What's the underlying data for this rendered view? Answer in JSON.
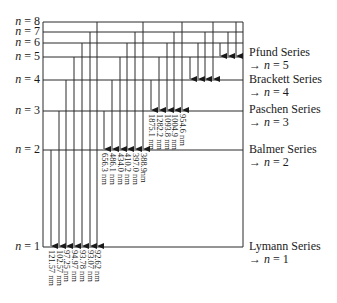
{
  "levels": [
    {
      "n": 1,
      "label": "n = 1",
      "y": 247
    },
    {
      "n": 2,
      "label": "n = 2",
      "y": 150
    },
    {
      "n": 3,
      "label": "n = 3",
      "y": 111
    },
    {
      "n": 4,
      "label": "n = 4",
      "y": 80
    },
    {
      "n": 5,
      "label": "n = 5",
      "y": 57
    },
    {
      "n": 6,
      "label": "n = 6",
      "y": 43
    },
    {
      "n": 7,
      "label": "n = 7",
      "y": 32
    },
    {
      "n": 8,
      "label": "n = 8",
      "y": 22
    }
  ],
  "series": [
    {
      "name": "Lymann Series",
      "target": "→ n = 1",
      "to_n": 1,
      "label_y": 240,
      "transitions": [
        {
          "from": 2,
          "x": 51,
          "wavelength": "121.57 nm"
        },
        {
          "from": 3,
          "x": 59,
          "wavelength": "102.57 nm"
        },
        {
          "from": 4,
          "x": 66,
          "wavelength": "97.25 nm"
        },
        {
          "from": 5,
          "x": 74,
          "wavelength": "94.97 nm"
        },
        {
          "from": 6,
          "x": 82,
          "wavelength": "93.78 nm"
        },
        {
          "from": 7,
          "x": 90,
          "wavelength": "93.07 nm"
        },
        {
          "from": 8,
          "x": 97,
          "wavelength": "92.62 nm"
        }
      ]
    },
    {
      "name": "Balmer Series",
      "target": "→ n = 2",
      "to_n": 2,
      "label_y": 143,
      "transitions": [
        {
          "from": 3,
          "x": 104,
          "wavelength": "656.3 nm"
        },
        {
          "from": 4,
          "x": 112,
          "wavelength": "486.1 nm"
        },
        {
          "from": 5,
          "x": 120,
          "wavelength": "434.0 nm"
        },
        {
          "from": 6,
          "x": 127,
          "wavelength": "410.2 nm"
        },
        {
          "from": 7,
          "x": 135,
          "wavelength": "397.0 nm"
        },
        {
          "from": 8,
          "x": 143,
          "wavelength": "388.9nm"
        }
      ]
    },
    {
      "name": "Paschen Series",
      "target": "→ n = 3",
      "to_n": 3,
      "label_y": 103,
      "transitions": [
        {
          "from": 4,
          "x": 151,
          "wavelength": "1875.1 nm"
        },
        {
          "from": 5,
          "x": 159,
          "wavelength": "1282.2 nm"
        },
        {
          "from": 6,
          "x": 167,
          "wavelength": "1093.8 nm"
        },
        {
          "from": 7,
          "x": 174,
          "wavelength": "1004.9 nm"
        },
        {
          "from": 8,
          "x": 182,
          "wavelength": "954.6 nm"
        }
      ]
    },
    {
      "name": "Brackett Series",
      "target": "→ n = 4",
      "to_n": 4,
      "label_y": 73,
      "transitions": [
        {
          "from": 5,
          "x": 190
        },
        {
          "from": 6,
          "x": 198
        },
        {
          "from": 7,
          "x": 205
        },
        {
          "from": 8,
          "x": 213
        }
      ]
    },
    {
      "name": "Pfund Series",
      "target": "→ n = 5",
      "to_n": 5,
      "label_y": 46,
      "transitions": [
        {
          "from": 6,
          "x": 220
        },
        {
          "from": 7,
          "x": 228
        },
        {
          "from": 8,
          "x": 236
        }
      ]
    }
  ],
  "layout": {
    "left": 43,
    "right": 243,
    "line_color": "#2a2a2a"
  }
}
